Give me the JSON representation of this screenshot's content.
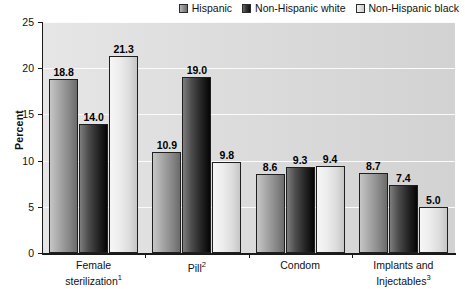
{
  "chart_data": {
    "type": "bar",
    "title": "",
    "xlabel": "",
    "ylabel": "Percent",
    "ylim": [
      0,
      25
    ],
    "yticks": [
      0,
      5,
      10,
      15,
      20,
      25
    ],
    "grid": true,
    "legend_position": "top-right",
    "categories": [
      "Female sterilization",
      "Pill",
      "Condom",
      "Implants and Injectables"
    ],
    "category_footnotes": [
      "1",
      "2",
      "",
      "3"
    ],
    "series": [
      {
        "name": "Hispanic",
        "values": [
          18.8,
          10.9,
          8.6,
          8.7
        ],
        "color": "#8a8a8a"
      },
      {
        "name": "Non-Hispanic white",
        "values": [
          14.0,
          19.0,
          9.3,
          7.4
        ],
        "color": "#121212"
      },
      {
        "name": "Non-Hispanic black",
        "values": [
          21.3,
          9.8,
          9.4,
          5.0
        ],
        "color": "#dcdcdc"
      }
    ],
    "value_labels": [
      [
        "18.8",
        "14.0",
        "21.3"
      ],
      [
        "10.9",
        "19.0",
        "9.8"
      ],
      [
        "8.6",
        "9.3",
        "9.4"
      ],
      [
        "8.7",
        "7.4",
        "5.0"
      ]
    ]
  },
  "axis": {
    "y_tick_labels": [
      "0",
      "5",
      "10",
      "15",
      "20",
      "25"
    ],
    "y_title": "Percent"
  },
  "legend": {
    "items": [
      {
        "label": "Hispanic"
      },
      {
        "label": "Non-Hispanic white"
      },
      {
        "label": "Non-Hispanic black"
      }
    ]
  },
  "categories_display": [
    {
      "line1": "Female",
      "line2": "sterilization",
      "sup": "1"
    },
    {
      "line1": "Pill",
      "line2": "",
      "sup": "2"
    },
    {
      "line1": "Condom",
      "line2": "",
      "sup": ""
    },
    {
      "line1": "Implants and",
      "line2": "Injectables",
      "sup": "3"
    }
  ]
}
